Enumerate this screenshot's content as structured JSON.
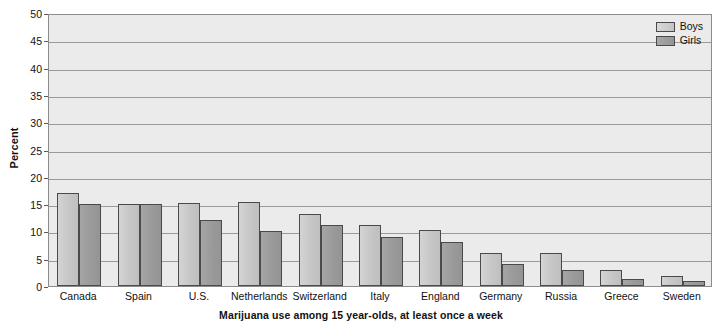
{
  "chart_data": {
    "type": "bar",
    "title": "",
    "caption": "Marijuana use among 15 year-olds, at least once a week",
    "xlabel": "",
    "ylabel": "Percent",
    "ylim": [
      0,
      50
    ],
    "ytick_step": 5,
    "yticks": [
      "50",
      "45",
      "40",
      "35",
      "30",
      "25",
      "20",
      "15",
      "10",
      "5",
      "0"
    ],
    "grid": true,
    "legend_position": "top-right",
    "categories": [
      "Canada",
      "Spain",
      "U.S.",
      "Netherlands",
      "Switzerland",
      "Italy",
      "England",
      "Germany",
      "Russia",
      "Greece",
      "Sweden"
    ],
    "series": [
      {
        "name": "Boys",
        "color": "#c6c6c6",
        "values": [
          17.0,
          15.1,
          15.2,
          15.3,
          13.1,
          11.2,
          10.2,
          6.0,
          6.0,
          2.9,
          1.9
        ]
      },
      {
        "name": "Girls",
        "color": "#9a9a9a",
        "values": [
          15.1,
          15.1,
          12.1,
          10.0,
          11.1,
          9.0,
          8.0,
          4.0,
          3.0,
          1.2,
          1.0
        ]
      }
    ]
  },
  "legend": {
    "items": [
      {
        "label": "Boys"
      },
      {
        "label": "Girls"
      }
    ]
  },
  "colors": {
    "plot_background": "#ebebeb",
    "gridline": "#9a9a9a",
    "axis": "#8c8c8c",
    "bar_outline": "#4a4a4a",
    "text": "#111111"
  }
}
